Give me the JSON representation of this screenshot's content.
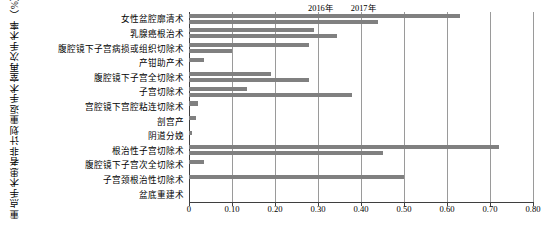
{
  "axis_title_y": "重点手术患者非计划重返手术室再次手术率（%）",
  "legend": {
    "position": "top-right",
    "items": [
      {
        "label": "2016年",
        "color": "#808080"
      },
      {
        "label": "2017年",
        "color": "#808080"
      }
    ]
  },
  "xticks": [
    "0",
    "0.10",
    "0.20",
    "0.30",
    "0.40",
    "0.50",
    "0.60",
    "0.70",
    "0.80"
  ],
  "chart_data": {
    "type": "bar",
    "orientation": "horizontal",
    "title": "",
    "xlabel": "",
    "ylabel": "重点手术患者非计划重返手术室再次手术率（%）",
    "xlim": [
      0,
      0.8
    ],
    "xtick_values": [
      0,
      0.1,
      0.2,
      0.3,
      0.4,
      0.5,
      0.6,
      0.7,
      0.8
    ],
    "xtick_labels": [
      "0",
      "0.10",
      "0.20",
      "0.30",
      "0.40",
      "0.50",
      "0.60",
      "0.70",
      "0.80"
    ],
    "grid": true,
    "grid_axis": "x",
    "legend_position": "top-right",
    "categories": [
      "女性盆腔廓清术",
      "乳腺癌根治术",
      "腹腔镜下子宫病损或组织切除术",
      "产钳助产术",
      "腹腔镜下子宫全切除术",
      "子宫切除术",
      "宫腔镜下宫腔粘连切除术",
      "剖宫产",
      "阴道分娩",
      "根治性子宫切除术",
      "腹腔镜下子宫次全切除术",
      "子宫颈根治性切除术",
      "盆底重建术"
    ],
    "series": [
      {
        "name": "2016年",
        "color": "#808080",
        "values": [
          0.63,
          0.29,
          0.28,
          0.035,
          0.19,
          0.135,
          0.022,
          0.017,
          0.008,
          0.72,
          0.035,
          0.5,
          0.0
        ]
      },
      {
        "name": "2017年",
        "color": "#808080",
        "values": [
          0.44,
          0.345,
          0.1,
          0.0,
          0.28,
          0.38,
          0.0,
          0.0,
          0.0,
          0.45,
          0.0,
          0.0,
          0.0
        ]
      }
    ]
  }
}
